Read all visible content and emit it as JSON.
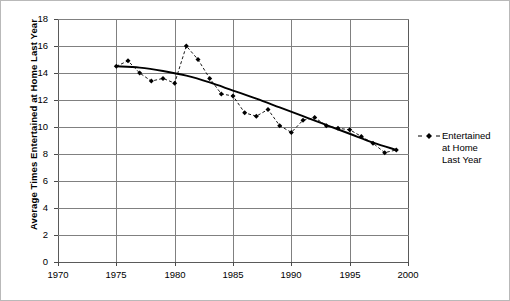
{
  "chart_data": {
    "type": "line",
    "title": "",
    "xlabel": "",
    "ylabel": "Average Times Entertained at Home Last Year",
    "xlim": [
      1970,
      2000
    ],
    "ylim": [
      0,
      18
    ],
    "xticks": [
      1970,
      1975,
      1980,
      1985,
      1990,
      1995,
      2000
    ],
    "yticks": [
      0,
      2,
      4,
      6,
      8,
      10,
      12,
      14,
      16,
      18
    ],
    "grid": true,
    "legend_position": "right",
    "series": [
      {
        "name": "Entertained at Home Last Year",
        "style": "dashed-with-diamond-markers",
        "color": "#000000",
        "x": [
          1975,
          1976,
          1977,
          1978,
          1979,
          1980,
          1981,
          1982,
          1983,
          1984,
          1985,
          1986,
          1987,
          1988,
          1989,
          1990,
          1991,
          1992,
          1993,
          1994,
          1995,
          1996,
          1997,
          1998,
          1999
        ],
        "values": [
          14.5,
          14.9,
          14.0,
          13.4,
          13.6,
          13.25,
          16.0,
          15.0,
          13.6,
          12.45,
          12.3,
          11.05,
          10.8,
          11.3,
          10.1,
          9.6,
          10.5,
          10.7,
          10.1,
          9.9,
          9.8,
          9.3,
          8.8,
          8.1,
          8.3
        ]
      },
      {
        "name": "trend",
        "style": "solid-smooth",
        "color": "#000000",
        "x": [
          1975,
          1977,
          1979,
          1981,
          1983,
          1985,
          1987,
          1989,
          1991,
          1993,
          1995,
          1997,
          1999
        ],
        "values": [
          14.5,
          14.4,
          14.15,
          13.8,
          13.3,
          12.7,
          12.1,
          11.45,
          10.8,
          10.15,
          9.5,
          8.85,
          8.3
        ]
      }
    ],
    "legend": [
      {
        "label_lines": [
          "Entertained",
          "at Home",
          "Last Year"
        ],
        "marker": "diamond",
        "line": "dashed"
      }
    ]
  },
  "legend": {
    "line1": "Entertained",
    "line2": "at Home",
    "line3": "Last Year"
  },
  "axes": {
    "y_title": "Average Times Entertained at Home Last Year"
  }
}
